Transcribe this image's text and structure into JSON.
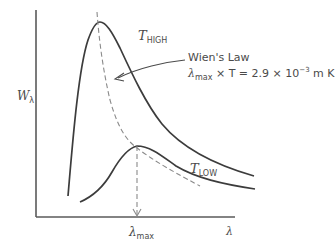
{
  "figure": {
    "axes": {
      "y_label_main": "W",
      "y_label_sub": "λ",
      "x_label": "λ",
      "color": "#5a5a5a"
    },
    "curves": [
      {
        "name": "T_HIGH",
        "label_main": "T",
        "label_sub": "HIGH",
        "style": "solid",
        "peak_x_px": 99,
        "peak_y_px": 22
      },
      {
        "name": "T_LOW",
        "label_main": "T",
        "label_sub": "LOW",
        "style": "solid",
        "peak_x_px": 137,
        "peak_y_px": 146
      }
    ],
    "wien_locus": {
      "style": "dashed",
      "color": "#8a8a8a"
    },
    "annotation": {
      "title": "Wien's Law",
      "formula_lambda": "λ",
      "formula_sub": "max",
      "formula_rest_before_exp": " × T = 2.9 × 10",
      "formula_exp": "−3",
      "formula_units": " m K"
    },
    "marker": {
      "label_main": "λ",
      "label_sub": "max",
      "style": "dashed-arrow"
    },
    "colors": {
      "curve": "#3c3c3c",
      "dashed": "#8a8a8a",
      "text": "#4a4a4a",
      "background": "#ffffff"
    }
  }
}
